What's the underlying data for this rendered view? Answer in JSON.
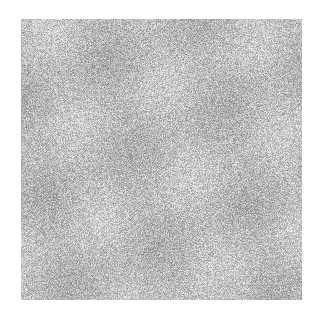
{
  "canvas": {
    "width": 318,
    "height": 314,
    "background": "#ffffff"
  },
  "noise_square": {
    "x": 21,
    "y": 19,
    "width": 281,
    "height": 281,
    "base_gray": 189,
    "gray_min": 136,
    "gray_max": 238,
    "blotch_strength": 14,
    "seed": 1337
  }
}
